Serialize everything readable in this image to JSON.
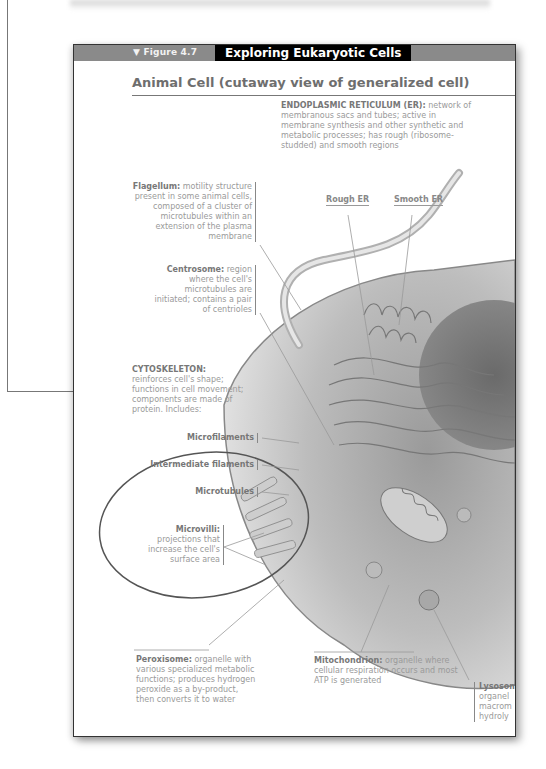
{
  "figure": {
    "number": "▼ Figure 4.7",
    "title": "Exploring Eukaryotic Cells",
    "section_title": "Animal Cell (cutaway view of generalized cell)"
  },
  "labels": {
    "er": {
      "term": "ENDOPLASMIC RETICULUM (ER):",
      "text": "network of membranous sacs and tubes; active in membrane synthesis and other synthetic and metabolic processes; has rough (ribosome-studded) and smooth regions",
      "rough": "Rough ER",
      "smooth": "Smooth ER"
    },
    "flagellum": {
      "term": "Flagellum:",
      "text": "motility structure present in some animal cells, composed of a cluster of microtubules within an extension of the plasma membrane"
    },
    "centrosome": {
      "term": "Centrosome:",
      "text": "region where the cell's microtubules are initiated; contains a pair of centrioles"
    },
    "cytoskeleton": {
      "term": "CYTOSKELETON:",
      "text": "reinforces cell's shape; functions in cell movement; components are made of protein. Includes:",
      "items": [
        "Microfilaments",
        "Intermediate filaments",
        "Microtubules"
      ]
    },
    "microvilli": {
      "term": "Microvilli:",
      "text": "projections that increase the cell's surface area"
    },
    "peroxisome": {
      "term": "Peroxisome:",
      "text": "organelle with various specialized metabolic functions; produces hydrogen peroxide as a by-product, then converts it to water"
    },
    "mitochondrion": {
      "term": "Mitochondrion:",
      "text": "organelle where cellular respiration occurs and most ATP is generated"
    },
    "lysosome": {
      "term": "Lysosom",
      "lines": [
        "organel",
        "macrom",
        "hydroly"
      ]
    }
  },
  "colors": {
    "header_gray": "#8a8a8a",
    "title_bg": "#000000",
    "label_text": "#9a9a9a",
    "callout_line": "#777777"
  }
}
